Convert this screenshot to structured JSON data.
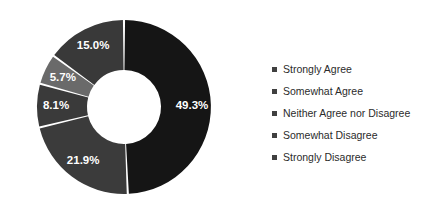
{
  "chart_data": {
    "type": "pie",
    "variant": "donut",
    "title": "",
    "xlabel": "",
    "ylabel": "",
    "grid": false,
    "legend_position": "right",
    "start_angle_deg": 0,
    "direction": "clockwise",
    "center": {
      "x": 124,
      "y": 107
    },
    "outer_radius": 87,
    "inner_radius": 37,
    "gap_color": "#ffffff",
    "categories": [
      "Strongly Agree",
      "Somewhat Agree",
      "Neither Agree nor Disagree",
      "Somewhat Disagree",
      "Strongly Disagree"
    ],
    "values": [
      49.3,
      21.9,
      8.1,
      5.7,
      15.0
    ],
    "data_labels": [
      "49.3%",
      "21.9%",
      "8.1%",
      "5.7%",
      "15.0%"
    ],
    "colors": [
      "#151515",
      "#3b3b3b",
      "#3a3a3a",
      "#6a6a6a",
      "#393939"
    ],
    "label_color": "#ffffff"
  },
  "legend": {
    "marker_color": "#404040",
    "items": [
      {
        "label": "Strongly Agree",
        "color": "#151515"
      },
      {
        "label": "Somewhat Agree",
        "color": "#3b3b3b"
      },
      {
        "label": "Neither Agree nor Disagree",
        "color": "#3a3a3a"
      },
      {
        "label": "Somewhat Disagree",
        "color": "#6a6a6a"
      },
      {
        "label": "Strongly Disagree",
        "color": "#393939"
      }
    ]
  }
}
